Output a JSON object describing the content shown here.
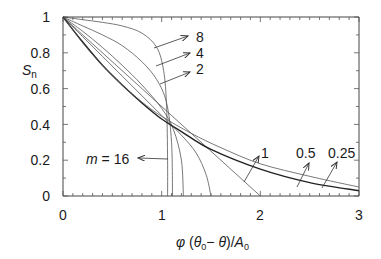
{
  "chart_data": {
    "type": "line",
    "title": "",
    "xlabel": "φ (θ0 − θ)/A0",
    "ylabel": "Sn",
    "xlim": [
      0,
      3
    ],
    "ylim": [
      0,
      1
    ],
    "grid": false,
    "x_ticks": [
      "0",
      "1",
      "2",
      "3"
    ],
    "y_ticks": [
      "0",
      "0.2",
      "0.4",
      "0.6",
      "0.8",
      "1"
    ],
    "series": [
      {
        "name": "m = 16",
        "points": [
          [
            0,
            1
          ],
          [
            0.2,
            0.985
          ],
          [
            0.4,
            0.97
          ],
          [
            0.6,
            0.95
          ],
          [
            0.8,
            0.91
          ],
          [
            0.95,
            0.83
          ],
          [
            1.02,
            0.7
          ],
          [
            1.05,
            0.5
          ],
          [
            1.06,
            0.2
          ],
          [
            1.06,
            0
          ]
        ]
      },
      {
        "name": "8",
        "points": [
          [
            0,
            1
          ],
          [
            0.2,
            0.95
          ],
          [
            0.4,
            0.9
          ],
          [
            0.6,
            0.84
          ],
          [
            0.8,
            0.75
          ],
          [
            0.95,
            0.65
          ],
          [
            1.05,
            0.52
          ],
          [
            1.1,
            0.3
          ],
          [
            1.11,
            0
          ]
        ]
      },
      {
        "name": "4",
        "points": [
          [
            0,
            1
          ],
          [
            0.2,
            0.92
          ],
          [
            0.4,
            0.83
          ],
          [
            0.6,
            0.73
          ],
          [
            0.8,
            0.62
          ],
          [
            1.0,
            0.49
          ],
          [
            1.12,
            0.37
          ],
          [
            1.2,
            0.2
          ],
          [
            1.22,
            0
          ]
        ]
      },
      {
        "name": "2",
        "points": [
          [
            0,
            1
          ],
          [
            0.2,
            0.89
          ],
          [
            0.4,
            0.78
          ],
          [
            0.6,
            0.67
          ],
          [
            0.8,
            0.56
          ],
          [
            1.0,
            0.45
          ],
          [
            1.2,
            0.34
          ],
          [
            1.35,
            0.24
          ],
          [
            1.45,
            0.12
          ],
          [
            1.5,
            0
          ]
        ]
      },
      {
        "name": "1",
        "points": [
          [
            0,
            1
          ],
          [
            2,
            0
          ]
        ]
      },
      {
        "name": "0.5",
        "points": [
          [
            0,
            1
          ],
          [
            0.2,
            0.86
          ],
          [
            0.4,
            0.73
          ],
          [
            0.6,
            0.62
          ],
          [
            0.8,
            0.52
          ],
          [
            1.0,
            0.43
          ],
          [
            1.2,
            0.36
          ],
          [
            1.5,
            0.26
          ],
          [
            2.0,
            0.15
          ],
          [
            2.5,
            0.075
          ],
          [
            3.0,
            0.03
          ]
        ]
      },
      {
        "name": "0.25",
        "points": [
          [
            0,
            1
          ],
          [
            0.2,
            0.855
          ],
          [
            0.4,
            0.73
          ],
          [
            0.6,
            0.62
          ],
          [
            0.8,
            0.525
          ],
          [
            1.0,
            0.445
          ],
          [
            1.3,
            0.35
          ],
          [
            1.6,
            0.27
          ],
          [
            2.0,
            0.18
          ],
          [
            2.5,
            0.11
          ],
          [
            3.0,
            0.05
          ]
        ]
      }
    ],
    "annotations": [
      {
        "text": "8",
        "arrow_to": [
          0.95,
          0.83
        ]
      },
      {
        "text": "4",
        "arrow_to": [
          0.98,
          0.6
        ]
      },
      {
        "text": "2",
        "arrow_to": [
          1.0,
          0.45
        ]
      },
      {
        "text": "m = 16",
        "arrow_to": [
          1.06,
          0.2
        ]
      },
      {
        "text": "1",
        "arrow_to": [
          1.75,
          0.12
        ]
      },
      {
        "text": "0.5",
        "arrow_to": [
          2.45,
          0.1
        ]
      },
      {
        "text": "0.25",
        "arrow_to": [
          2.7,
          0.12
        ]
      }
    ]
  },
  "labels": {
    "y_axis_main": "S",
    "y_axis_sub": "n",
    "x_axis_phi": "φ",
    "x_axis_open": " (",
    "x_axis_theta0": "θ",
    "x_axis_sub0": "0",
    "x_axis_minus": "− ",
    "x_axis_theta": "θ",
    "x_axis_close": ")/",
    "x_axis_A": "A",
    "x_axis_subA": "0",
    "m_label_m": "m",
    "m_label_rest": " = 16",
    "ann_8": "8",
    "ann_4": "4",
    "ann_2": "2",
    "ann_1": "1",
    "ann_05": "0.5",
    "ann_025": "0.25"
  }
}
